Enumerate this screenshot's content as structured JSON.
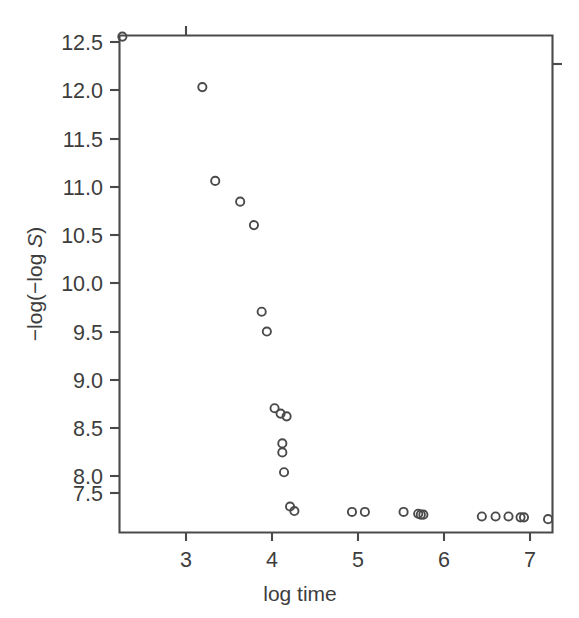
{
  "chart_data": {
    "type": "scatter",
    "title": "",
    "subtitle": "",
    "xlabel": "log time",
    "ylabel": "-log(-log S)",
    "ylabel_parts": {
      "prefix": "−log(−log ",
      "italic": "S",
      "suffix": ")"
    },
    "xlim": [
      2.22,
      7.25
    ],
    "ylim": [
      7.2,
      12.65
    ],
    "grid": false,
    "legend": null,
    "xticks": [
      3,
      4,
      5,
      6,
      7
    ],
    "xtick_labels": [
      "3",
      "4",
      "5",
      "6",
      "7"
    ],
    "yticks": [
      7.5,
      8.0,
      8.5,
      9.0,
      9.5,
      10.0,
      10.5,
      11.0,
      11.5,
      12.0,
      12.5
    ],
    "ytick_labels": [
      "7.5",
      "8.0",
      "8.5",
      "9.0",
      "9.5",
      "10.0",
      "10.5",
      "11.0",
      "11.5",
      "12.0",
      "12.5"
    ],
    "marker": "open-circle",
    "marker_color": "#4a4a4a",
    "n_points": 30,
    "x": [
      2.26,
      3.19,
      3.34,
      3.63,
      3.79,
      3.88,
      3.94,
      4.03,
      4.1,
      4.16,
      4.24,
      4.24,
      4.26,
      4.36,
      4.43,
      4.93,
      5.08,
      5.53,
      5.69,
      5.73,
      5.77,
      6.42,
      6.59,
      6.74,
      6.89,
      6.93,
      7.21
    ],
    "y": [
      12.56,
      12.0,
      10.96,
      10.73,
      10.47,
      9.51,
      9.29,
      8.44,
      8.38,
      8.32,
      8.05,
      7.95,
      7.7,
      7.33,
      7.28,
      7.28,
      7.28,
      7.28,
      7.25,
      7.24,
      7.24,
      7.24,
      7.24,
      7.24,
      7.23,
      7.22,
      7.21
    ],
    "points": [
      [
        2.26,
        12.56
      ],
      [
        3.19,
        12.0
      ],
      [
        3.34,
        10.96
      ],
      [
        3.63,
        10.73
      ],
      [
        3.79,
        10.47
      ],
      [
        3.88,
        9.51
      ],
      [
        3.94,
        9.29
      ],
      [
        4.03,
        8.44
      ],
      [
        4.1,
        8.38
      ],
      [
        4.17,
        8.35
      ],
      [
        4.12,
        8.05
      ],
      [
        4.12,
        7.95
      ],
      [
        4.14,
        7.73
      ],
      [
        4.21,
        7.35
      ],
      [
        4.26,
        7.3
      ],
      [
        4.93,
        7.29
      ],
      [
        5.08,
        7.29
      ],
      [
        5.53,
        7.29
      ],
      [
        5.7,
        7.27
      ],
      [
        5.73,
        7.26
      ],
      [
        5.76,
        7.26
      ],
      [
        6.44,
        7.24
      ],
      [
        6.6,
        7.24
      ],
      [
        6.75,
        7.24
      ],
      [
        6.89,
        7.23
      ],
      [
        6.93,
        7.23
      ],
      [
        7.21,
        7.21
      ]
    ]
  },
  "axes": {
    "x_axis_label": "log time",
    "y_axis_label_prefix": "−log(−log ",
    "y_axis_label_italic": "S",
    "y_axis_label_suffix": ")",
    "x_tick_labels": [
      "3",
      "4",
      "5",
      "6",
      "7"
    ],
    "y_tick_labels": [
      "12.5",
      "12.0",
      "11.5",
      "11.0",
      "10.5",
      "10.0",
      "9.5",
      "9.0",
      "8.5",
      "8.0",
      "7.5"
    ]
  },
  "style": {
    "background": "#ffffff",
    "axis_color": "#4a4a4a",
    "marker_color": "#4a4a4a",
    "text_color": "#3d3d3d"
  }
}
